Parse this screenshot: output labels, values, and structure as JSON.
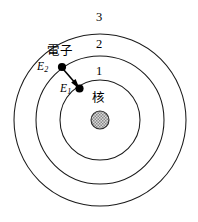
{
  "figure": {
    "background_color": "#ffffff",
    "line_color": "#1a1a1a",
    "nucleus_color": "#9a9a9a"
  },
  "shells": [
    {
      "id": "shell-1",
      "label": "1",
      "radius": 40,
      "label_x": 97,
      "label_y": 66
    },
    {
      "id": "shell-2",
      "label": "2",
      "radius": 64,
      "label_x": 97,
      "label_y": 39
    },
    {
      "id": "shell-3",
      "label": "3",
      "radius": 86,
      "label_x": 97,
      "label_y": 13
    }
  ],
  "nucleus": {
    "label": "核",
    "label_x": 91,
    "label_y": 93,
    "center_x": 100,
    "center_y": 120,
    "radius": 9
  },
  "electron": {
    "label": "電子",
    "label_x": 47,
    "label_y": 47,
    "outer_state": {
      "x": 62,
      "y": 67
    },
    "inner_state": {
      "x": 79,
      "y": 88
    }
  },
  "energy_levels": [
    {
      "id": "energy-outer",
      "symbol": "E",
      "subscript": "2",
      "x": 36,
      "y": 61
    },
    {
      "id": "energy-inner",
      "symbol": "E",
      "subscript": "1",
      "x": 59,
      "y": 83
    }
  ],
  "transition": {
    "from_x": 63,
    "from_y": 69,
    "to_x": 78,
    "to_y": 87,
    "direction": "inward"
  }
}
